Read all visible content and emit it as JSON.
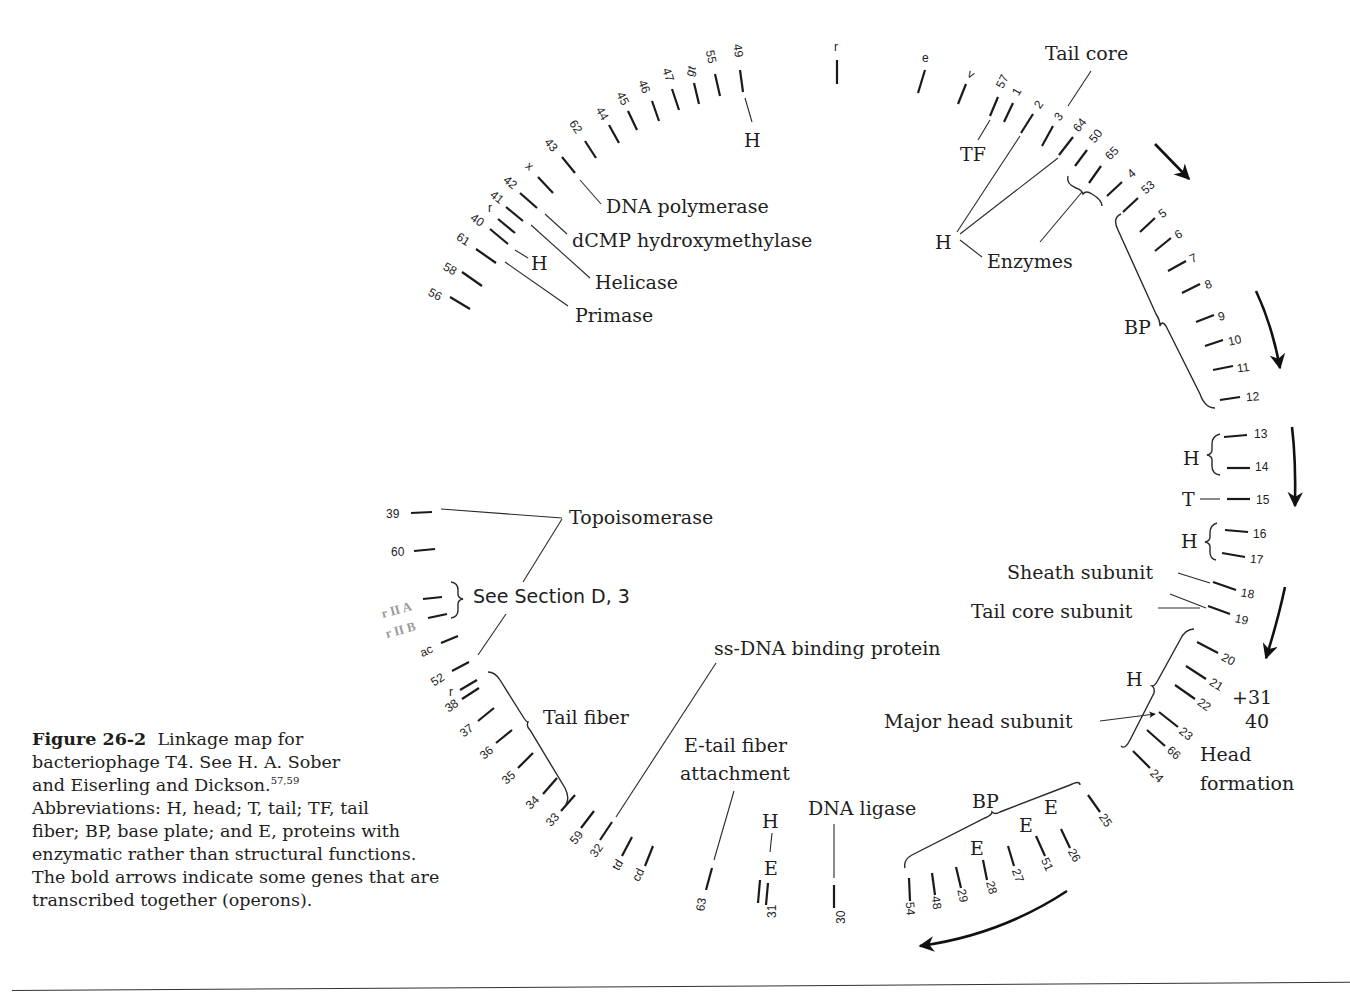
{
  "figure": {
    "number": "Figure 26-2",
    "caption_lines": [
      "Linkage map for",
      "bacteriophage T4.  See H. A. Sober",
      "and Eiserling and Dickson.",
      "Abbreviations:  H, head; T, tail; TF, tail",
      "fiber; BP, base plate; and E, proteins with",
      "enzymatic rather than structural functions.",
      "The bold arrows indicate some genes that are",
      "transcribed together (operons)."
    ],
    "citation_superscript": "57,59"
  },
  "genes": {
    "g56": "56",
    "g58": "58",
    "g61": "61",
    "g40": "40",
    "g41r": "r",
    "g41": "41",
    "g42": "42",
    "gx": "x",
    "g43": "43",
    "g62": "62",
    "g44": "44",
    "g45": "45",
    "g46": "46",
    "g47": "47",
    "ggt": "gt",
    "g55": "55",
    "g49": "49",
    "gr_top": "r",
    "ge": "e",
    "gv": "v",
    "g57": "57",
    "g1": "1",
    "g2": "2",
    "g3": "3",
    "g64": "64",
    "g50": "50",
    "g65": "65",
    "g4": "4",
    "g53": "53",
    "g5": "5",
    "g6": "6",
    "g7": "7",
    "g8": "8",
    "g9": "9",
    "g10": "10",
    "g11": "11",
    "g12": "12",
    "g13": "13",
    "g14": "14",
    "g15": "15",
    "g16": "16",
    "g17": "17",
    "g18": "18",
    "g19": "19",
    "g20": "20",
    "g21": "21",
    "g22": "22",
    "g23": "23",
    "g66": "66",
    "g24": "24",
    "g25": "25",
    "g26": "26",
    "g51": "51",
    "g27": "27",
    "g28": "28",
    "g29": "29",
    "g48": "48",
    "g54": "54",
    "g30": "30",
    "g31": "31",
    "g63": "63",
    "gcd": "cd",
    "gtd": "td",
    "g32": "32",
    "g59": "59",
    "g33": "33",
    "g34": "34",
    "g35": "35",
    "g36": "36",
    "g37": "37",
    "g38": "38",
    "gr_low": "r",
    "g52": "52",
    "gac": "ac",
    "grIIB": "r II B",
    "grIIA": "r II A",
    "g60": "60",
    "g39": "39"
  },
  "annotations": {
    "dna_polymerase": "DNA polymerase",
    "dcmp": "dCMP hydroxymethylase",
    "helicase": "Helicase",
    "primase": "Primase",
    "h_40": "H",
    "h_49": "H",
    "tail_core": "Tail core",
    "tf": "TF",
    "h_enzymes": "H",
    "enzymes": "Enzymes",
    "bp_top": "BP",
    "h_13_14": "H",
    "t_15": "T",
    "h_16_17": "H",
    "sheath_subunit": "Sheath subunit",
    "tail_core_subunit": "Tail core subunit",
    "h_head": "H",
    "plus31": "+31",
    "forty": "40",
    "major_head_subunit": "Major head subunit",
    "head_formation_1": "Head",
    "head_formation_2": "formation",
    "bp_bottom": "BP",
    "e_28": "E",
    "e_51": "E",
    "e_26": "E",
    "dna_ligase": "DNA ligase",
    "h_31": "H",
    "e_31": "E",
    "e_tail_fiber_1": "E-tail fiber",
    "e_tail_fiber_2": "attachment",
    "ss_dna": "ss-DNA binding protein",
    "tail_fiber": "Tail fiber",
    "see_section": "See Section D, 3",
    "topoisomerase": "Topoisomerase"
  },
  "operon_arrows": [
    {
      "id": "arrow-1",
      "near_genes": "53-5"
    },
    {
      "id": "arrow-2",
      "near_genes": "8-11"
    },
    {
      "id": "arrow-3",
      "near_genes": "13-15"
    },
    {
      "id": "arrow-4",
      "near_genes": "19-20"
    },
    {
      "id": "arrow-5",
      "near_genes": "25-54"
    }
  ]
}
